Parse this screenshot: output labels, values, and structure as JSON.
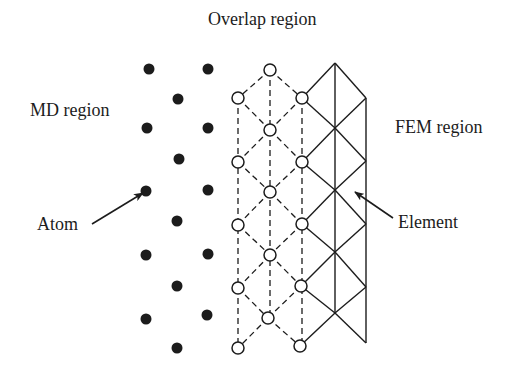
{
  "labels": {
    "overlap": "Overlap region",
    "md": "MD region",
    "fem": "FEM region",
    "atom": "Atom",
    "element": "Element"
  },
  "colors": {
    "ink": "#1c1c1c",
    "background": "#ffffff"
  },
  "md_atoms": [
    [
      149,
      69
    ],
    [
      208,
      69
    ],
    [
      178,
      99
    ],
    [
      147,
      128
    ],
    [
      208,
      128
    ],
    [
      179,
      159
    ],
    [
      146,
      191
    ],
    [
      208,
      190
    ],
    [
      177,
      221
    ],
    [
      146,
      255
    ],
    [
      208,
      254
    ],
    [
      177,
      286
    ],
    [
      146,
      319
    ],
    [
      207,
      315
    ],
    [
      177,
      348
    ]
  ],
  "overlap_nodes": [
    [
      270,
      70
    ],
    [
      238,
      98
    ],
    [
      302,
      98
    ],
    [
      270,
      130
    ],
    [
      238,
      162
    ],
    [
      302,
      162
    ],
    [
      270,
      192
    ],
    [
      238,
      225
    ],
    [
      302,
      224
    ],
    [
      270,
      255
    ],
    [
      238,
      288
    ],
    [
      301,
      286
    ],
    [
      268,
      318
    ],
    [
      238,
      348
    ],
    [
      300,
      346
    ]
  ],
  "fem_mesh": {
    "center_x": 335,
    "right_x": 366,
    "top_vertex": [
      335,
      63
    ],
    "center_nodes_y": [
      63,
      128,
      190,
      252,
      313
    ],
    "right_nodes_y": [
      98,
      161,
      224,
      287,
      343
    ]
  },
  "arrows": {
    "atom": {
      "from": [
        92,
        224
      ],
      "to": [
        143,
        193
      ]
    },
    "element": {
      "from": [
        393,
        218
      ],
      "to": [
        355,
        192
      ]
    }
  }
}
